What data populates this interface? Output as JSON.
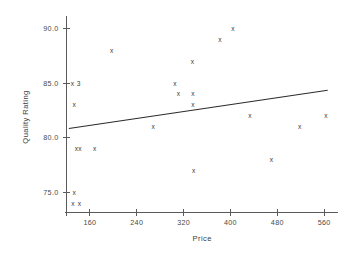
{
  "chart_data": {
    "type": "scatter",
    "title": "",
    "xlabel": "Price",
    "ylabel": "Quality Rating",
    "xlim": [
      120,
      570
    ],
    "ylim": [
      73.2,
      90.6
    ],
    "grid": false,
    "legend": null,
    "xticks": [
      160,
      240,
      320,
      400,
      480,
      560
    ],
    "xticklabels": [
      "160",
      "240",
      "320",
      "400",
      "480",
      "560"
    ],
    "yticks": [
      75.0,
      80.0,
      85.0,
      90.0
    ],
    "yticklabels": [
      "75.0",
      "80.0",
      "85.0",
      "90.0"
    ],
    "marker_symbol": "x",
    "points": [
      {
        "x": 130,
        "y": 85.0,
        "label": "3"
      },
      {
        "x": 133,
        "y": 83.0,
        "label": ""
      },
      {
        "x": 137,
        "y": 79.0,
        "label": ""
      },
      {
        "x": 143,
        "y": 79.0,
        "label": ""
      },
      {
        "x": 133,
        "y": 75.0,
        "label": ""
      },
      {
        "x": 131,
        "y": 74.0,
        "label": ""
      },
      {
        "x": 142,
        "y": 74.0,
        "label": ""
      },
      {
        "x": 168,
        "y": 79.0,
        "label": ""
      },
      {
        "x": 197,
        "y": 88.0,
        "label": ""
      },
      {
        "x": 268,
        "y": 81.0,
        "label": ""
      },
      {
        "x": 305,
        "y": 85.0,
        "label": ""
      },
      {
        "x": 311,
        "y": 84.0,
        "label": ""
      },
      {
        "x": 335,
        "y": 87.0,
        "label": ""
      },
      {
        "x": 336,
        "y": 84.0,
        "label": ""
      },
      {
        "x": 336,
        "y": 83.0,
        "label": ""
      },
      {
        "x": 337,
        "y": 77.0,
        "label": ""
      },
      {
        "x": 382,
        "y": 89.0,
        "label": ""
      },
      {
        "x": 404,
        "y": 90.0,
        "label": ""
      },
      {
        "x": 433,
        "y": 82.0,
        "label": ""
      },
      {
        "x": 470,
        "y": 78.0,
        "label": ""
      },
      {
        "x": 518,
        "y": 81.0,
        "label": ""
      },
      {
        "x": 563,
        "y": 82.0,
        "label": ""
      }
    ],
    "fit_line": {
      "type": "linear-regression",
      "x_start": 124,
      "y_start": 80.85,
      "x_end": 566,
      "y_end": 84.35
    }
  },
  "axes": {
    "x_axis_name": "price-axis",
    "y_axis_name": "quality-rating-axis"
  }
}
